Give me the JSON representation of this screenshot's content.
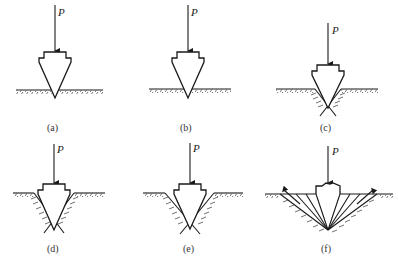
{
  "figure": {
    "load_symbol": "P",
    "panels": [
      {
        "id": "a",
        "caption": "(a)"
      },
      {
        "id": "b",
        "caption": "(b)"
      },
      {
        "id": "c",
        "caption": "(c)"
      },
      {
        "id": "d",
        "caption": "(d)"
      },
      {
        "id": "e",
        "caption": "(e)"
      },
      {
        "id": "f",
        "caption": "(f)"
      }
    ]
  },
  "colors": {
    "line": "#1a1a1a",
    "background": "#ffffff"
  }
}
